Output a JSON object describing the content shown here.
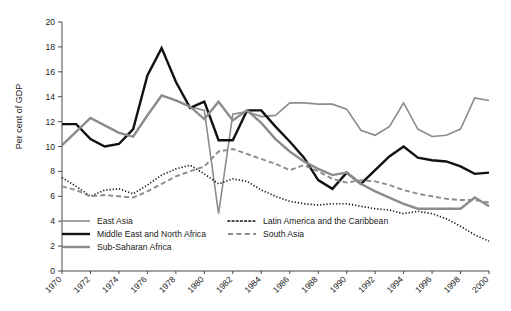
{
  "chart_data": {
    "type": "line",
    "title": "",
    "subtitle": "",
    "xlabel": "",
    "ylabel": "Per cent of GDP",
    "xlim": [
      1970,
      2000
    ],
    "ylim": [
      0,
      20
    ],
    "ytick_step": 2,
    "xtick_step": 2,
    "grid": false,
    "legend_position": "inside-bottom-left",
    "yticks": [
      "0",
      "2",
      "4",
      "6",
      "8",
      "10",
      "12",
      "14",
      "16",
      "18",
      "20"
    ],
    "xticks": [
      "1970",
      "1972",
      "1974",
      "1976",
      "1978",
      "1980",
      "1982",
      "1984",
      "1986",
      "1988",
      "1990",
      "1992",
      "1994",
      "1996",
      "1998",
      "2000"
    ],
    "x": [
      1970,
      1971,
      1972,
      1973,
      1974,
      1975,
      1976,
      1977,
      1978,
      1979,
      1980,
      1981,
      1982,
      1983,
      1984,
      1985,
      1986,
      1987,
      1988,
      1989,
      1990,
      1991,
      1992,
      1993,
      1994,
      1995,
      1996,
      1997,
      1998,
      1999,
      2000
    ],
    "series": [
      {
        "name": "East Asia",
        "style": "thin-solid-gray",
        "color": "#8c8c8c",
        "width": 1.6,
        "dash": "none",
        "values": [
          10.1,
          11.2,
          12.3,
          11.7,
          11.1,
          10.8,
          12.5,
          14.1,
          13.7,
          13.2,
          12.9,
          4.6,
          12.6,
          12.8,
          12.4,
          12.5,
          13.5,
          13.5,
          13.4,
          13.4,
          13.0,
          11.3,
          10.9,
          11.6,
          13.5,
          11.4,
          10.8,
          10.9,
          11.4,
          13.9,
          13.7
        ]
      },
      {
        "name": "Middle East and North Africa",
        "style": "thick-solid-black",
        "color": "#111111",
        "width": 2.4,
        "dash": "none",
        "values": [
          11.8,
          11.8,
          10.6,
          10.0,
          10.2,
          11.4,
          15.7,
          17.9,
          15.2,
          13.1,
          13.6,
          10.5,
          10.5,
          12.9,
          12.9,
          11.6,
          10.4,
          9.1,
          7.3,
          6.6,
          7.9,
          7.0,
          8.1,
          9.2,
          10.0,
          9.1,
          8.9,
          8.8,
          8.4,
          7.8,
          7.9
        ]
      },
      {
        "name": "Sub-Saharan Africa",
        "style": "thick-solid-gray",
        "color": "#8c8c8c",
        "width": 2.4,
        "dash": "none",
        "values": [
          10.1,
          11.2,
          12.3,
          11.7,
          11.1,
          10.8,
          12.5,
          14.1,
          13.7,
          13.2,
          12.2,
          13.6,
          12.1,
          12.9,
          11.9,
          10.6,
          9.6,
          8.8,
          8.2,
          7.7,
          7.9,
          7.0,
          6.4,
          5.9,
          5.4,
          5.0,
          5.0,
          5.0,
          5.0,
          5.9,
          5.2
        ]
      },
      {
        "name": "Latin America and the Caribbean",
        "style": "dotted",
        "color": "#111111",
        "width": 1.7,
        "dash": "1.2,2.0",
        "values": [
          7.5,
          6.8,
          6.0,
          6.5,
          6.6,
          6.2,
          6.9,
          7.7,
          8.2,
          8.5,
          7.8,
          7.0,
          7.4,
          7.2,
          6.5,
          6.0,
          5.6,
          5.4,
          5.3,
          5.4,
          5.4,
          5.2,
          5.0,
          4.9,
          4.6,
          4.8,
          4.6,
          4.2,
          3.6,
          2.9,
          2.4
        ]
      },
      {
        "name": "South Asia",
        "style": "dashed",
        "color": "#8c8c8c",
        "width": 1.9,
        "dash": "5,3",
        "values": [
          6.8,
          6.5,
          6.0,
          6.1,
          6.0,
          5.9,
          6.4,
          7.0,
          7.6,
          8.0,
          8.4,
          9.6,
          9.8,
          9.4,
          9.0,
          8.6,
          8.1,
          8.5,
          8.0,
          7.4,
          7.1,
          7.3,
          7.2,
          6.9,
          6.5,
          6.2,
          6.0,
          5.8,
          5.7,
          5.7,
          5.5
        ]
      }
    ],
    "legend": [
      {
        "label": "East Asia",
        "style": "thin-solid-gray",
        "color": "#8c8c8c"
      },
      {
        "label": "Middle East and North Africa",
        "style": "thick-solid-black",
        "color": "#111111"
      },
      {
        "label": "Sub-Saharan Africa",
        "style": "thick-solid-gray",
        "color": "#8c8c8c"
      },
      {
        "label": "Latin America and the Caribbean",
        "style": "dotted",
        "color": "#111111"
      },
      {
        "label": "South Asia",
        "style": "dashed",
        "color": "#8c8c8c"
      }
    ]
  }
}
